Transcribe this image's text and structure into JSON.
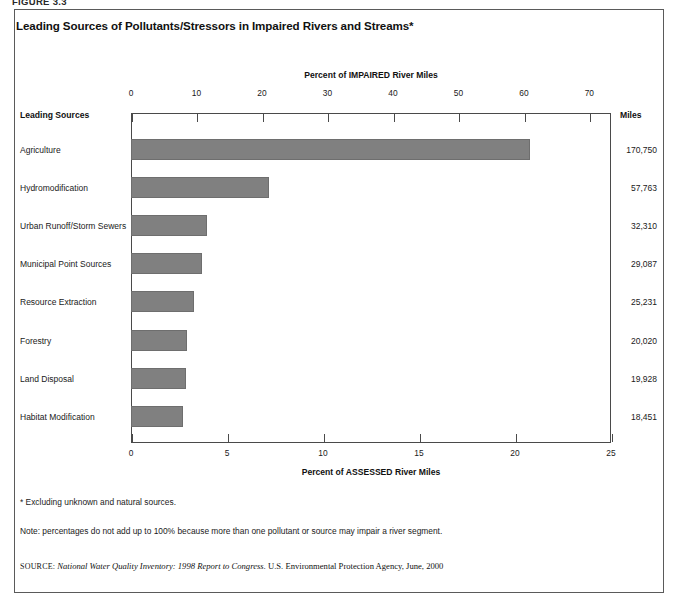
{
  "figure": {
    "caption": "FIGURE 3.3",
    "title": "Leading Sources of Pollutants/Stressors in Impaired Rivers and Streams*"
  },
  "headers": {
    "sources_column": "Leading Sources",
    "miles_column": "Miles"
  },
  "footnotes": {
    "asterisk": "* Excluding unknown and natural sources.",
    "note": "Note: percentages do not add up to 100% because more than one pollutant or source may impair a river segment."
  },
  "source": {
    "label": "SOURCE:",
    "publication": "National Water Quality Inventory: 1998 Report to Congress.",
    "attribution": "U.S. Environmental Protection Agency, June, 2000"
  },
  "colors": {
    "bar_fill": "#808080",
    "bar_border": "#6e6e6e",
    "axis": "#4a4a4a",
    "frame": "#5a5a5a",
    "text": "#1a1a1a"
  },
  "chart_data": {
    "type": "bar",
    "orientation": "horizontal",
    "title": "Leading Sources of Pollutants/Stressors in Impaired Rivers and Streams*",
    "top_axis_label": "Percent of IMPAIRED River Miles",
    "bottom_axis_label": "Percent of ASSESSED River Miles",
    "top_xlim": [
      0,
      73.3
    ],
    "bottom_xlim": [
      0,
      25
    ],
    "top_ticks": [
      0,
      10,
      20,
      30,
      40,
      50,
      60,
      70
    ],
    "bottom_ticks": [
      0,
      5,
      10,
      15,
      20,
      25
    ],
    "grid": false,
    "legend": "none",
    "categories": [
      "Agriculture",
      "Hydromodification",
      "Urban Runoff/Storm Sewers",
      "Municipal Point Sources",
      "Resource Extraction",
      "Forestry",
      "Land Disposal",
      "Habitat Modification"
    ],
    "series": [
      {
        "name": "Percent of IMPAIRED River Miles",
        "values": [
          60.9,
          21.1,
          11.6,
          10.8,
          9.6,
          8.5,
          8.4,
          7.9
        ]
      },
      {
        "name": "Percent of ASSESSED River Miles",
        "values": [
          20.3,
          7.0,
          3.9,
          3.6,
          3.2,
          2.8,
          2.8,
          2.6
        ]
      }
    ],
    "miles_labels": [
      "170,750",
      "57,763",
      "32,310",
      "29,087",
      "25,231",
      "20,020",
      "19,928",
      "18,451"
    ]
  }
}
